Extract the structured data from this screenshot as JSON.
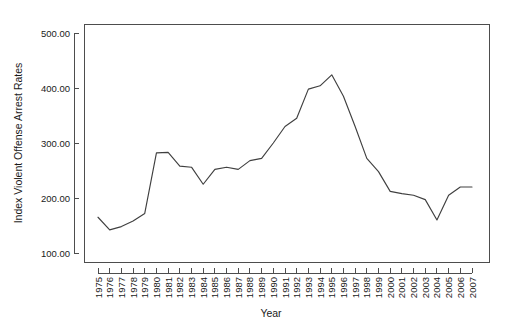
{
  "chart_data": {
    "type": "line",
    "title": "",
    "xlabel": "Year",
    "ylabel": "Index Violent Offense Arrest Rates",
    "grid": false,
    "legend": false,
    "legend_position": "none",
    "line_color": "#404040",
    "axis_color": "#4d4d4d",
    "background_color": "#ffffff",
    "xlim": [
      1975,
      2007
    ],
    "ylim": [
      100,
      500
    ],
    "y_ticks": [
      100,
      200,
      300,
      400,
      500
    ],
    "y_tick_labels": [
      "100.00",
      "200.00",
      "300.00",
      "400.00",
      "500.00"
    ],
    "x": [
      1975,
      1976,
      1977,
      1978,
      1979,
      1980,
      1981,
      1982,
      1983,
      1984,
      1985,
      1986,
      1987,
      1988,
      1989,
      1990,
      1991,
      1992,
      1993,
      1994,
      1995,
      1996,
      1997,
      1998,
      1999,
      2000,
      2001,
      2002,
      2003,
      2004,
      2005,
      2006,
      2007
    ],
    "x_tick_labels": [
      "1975",
      "1976",
      "1977",
      "1978",
      "1979",
      "1980",
      "1981",
      "1982",
      "1983",
      "1984",
      "1985",
      "1986",
      "1987",
      "1988",
      "1989",
      "1990",
      "1991",
      "1992",
      "1993",
      "1994",
      "1995",
      "1996",
      "1997",
      "1998",
      "1999",
      "2000",
      "2001",
      "2002",
      "2003",
      "2004",
      "2005",
      "2006",
      "2007"
    ],
    "categories": [
      "1975",
      "1976",
      "1977",
      "1978",
      "1979",
      "1980",
      "1981",
      "1982",
      "1983",
      "1984",
      "1985",
      "1986",
      "1987",
      "1988",
      "1989",
      "1990",
      "1991",
      "1992",
      "1993",
      "1994",
      "1995",
      "1996",
      "1997",
      "1998",
      "1999",
      "2000",
      "2001",
      "2002",
      "2003",
      "2004",
      "2005",
      "2006",
      "2007"
    ],
    "values": [
      165,
      142,
      148,
      158,
      172,
      282,
      283,
      258,
      256,
      225,
      252,
      256,
      252,
      268,
      272,
      300,
      330,
      345,
      398,
      404,
      424,
      385,
      330,
      272,
      248,
      212,
      208,
      205,
      197,
      160,
      205,
      220,
      220
    ],
    "series": [
      {
        "name": "Index Violent Offense Arrest Rates",
        "values": [
          165,
          142,
          148,
          158,
          172,
          282,
          283,
          258,
          256,
          225,
          252,
          256,
          252,
          268,
          272,
          300,
          330,
          345,
          398,
          404,
          424,
          385,
          330,
          272,
          248,
          212,
          208,
          205,
          197,
          160,
          205,
          220,
          220
        ]
      }
    ]
  }
}
